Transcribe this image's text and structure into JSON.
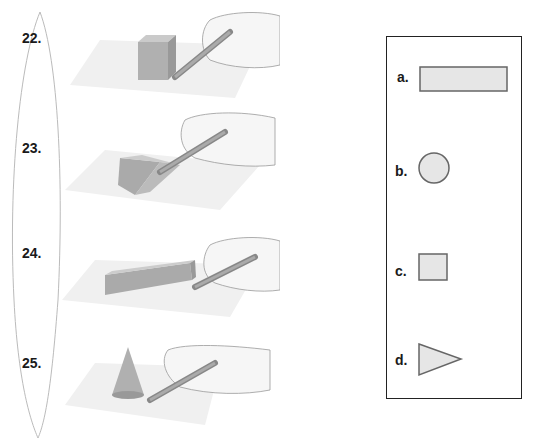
{
  "questions": [
    {
      "number": "22.",
      "solid": "cube"
    },
    {
      "number": "23.",
      "solid": "triangular-prism"
    },
    {
      "number": "24.",
      "solid": "rectangular-prism"
    },
    {
      "number": "25.",
      "solid": "cone"
    }
  ],
  "answer_choices": [
    {
      "label": "a.",
      "shape": "rectangle"
    },
    {
      "label": "b.",
      "shape": "circle"
    },
    {
      "label": "c.",
      "shape": "square"
    },
    {
      "label": "d.",
      "shape": "triangle"
    }
  ],
  "colors": {
    "shape_fill": "#e6e6e6",
    "shape_stroke": "#666666",
    "solid_fill": "#b5b5b5",
    "paper": "#efefef",
    "text": "#1a1a1a"
  }
}
